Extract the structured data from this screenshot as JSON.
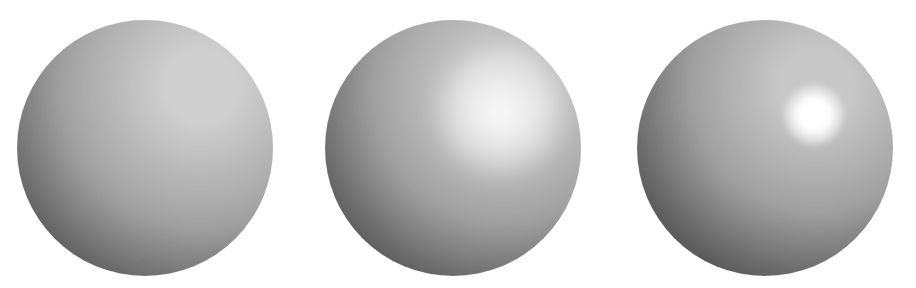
{
  "figure": {
    "background_color": "#ffffff",
    "width": 916,
    "height": 288,
    "light_direction": "upper-right",
    "sphere_count": 3
  },
  "palette": {
    "background": "#ffffff",
    "terminator_dark": "#1e1e1e",
    "shadow_mid": "#3a3a3a",
    "diffuse_mid": "#8a8a8a",
    "diffuse_light": "#b4b4b4",
    "highlight_soft": "#e8e8e8",
    "highlight_core": "#ffffff"
  },
  "chart_data": {
    "type": "scatter",
    "xlabel": "",
    "ylabel": "",
    "categories": [
      "diffuse only",
      "broad highlight",
      "tight highlight"
    ],
    "series": [
      {
        "name": "specular exponent",
        "values": [
          0,
          10,
          100
        ]
      },
      {
        "name": "highlight radius (px)",
        "values": [
          0,
          55,
          16
        ]
      },
      {
        "name": "highlight peak luminance (0-255)",
        "values": [
          182,
          238,
          255
        ]
      }
    ]
  },
  "spheres": [
    {
      "id": "sphere-diffuse",
      "label": "diffuse only",
      "center_x": 145,
      "center_y": 148,
      "radius": 128,
      "diffuse_peak_x_pct": 72,
      "diffuse_peak_y_pct": 26,
      "diffuse_light": "#c0c0c0",
      "diffuse_mid": "#8e8e8e",
      "diffuse_dark": "#232323",
      "has_specular": false,
      "specular_exponent": 0,
      "specular_radius": 0,
      "specular_center_x": 0,
      "specular_center_y": 0,
      "specular_peak_color": "rgba(255,255,255,0)"
    },
    {
      "id": "sphere-broad-highlight",
      "label": "broad highlight",
      "center_x": 453,
      "center_y": 148,
      "radius": 128,
      "diffuse_peak_x_pct": 70,
      "diffuse_peak_y_pct": 28,
      "diffuse_light": "#bcbcbc",
      "diffuse_mid": "#8a8a8a",
      "diffuse_dark": "#1f1f1f",
      "has_specular": true,
      "specular_exponent": 10,
      "specular_radius": 62,
      "specular_center_x": 500,
      "specular_center_y": 112,
      "specular_peak_color": "rgba(255,255,255,0.92)"
    },
    {
      "id": "sphere-tight-highlight",
      "label": "tight highlight",
      "center_x": 765,
      "center_y": 148,
      "radius": 128,
      "diffuse_peak_x_pct": 70,
      "diffuse_peak_y_pct": 26,
      "diffuse_light": "#b6b6b6",
      "diffuse_mid": "#848484",
      "diffuse_dark": "#1b1b1b",
      "has_specular": true,
      "specular_exponent": 100,
      "specular_radius": 30,
      "specular_center_x": 814,
      "specular_center_y": 115,
      "specular_peak_color": "rgba(255,255,255,1)"
    }
  ]
}
